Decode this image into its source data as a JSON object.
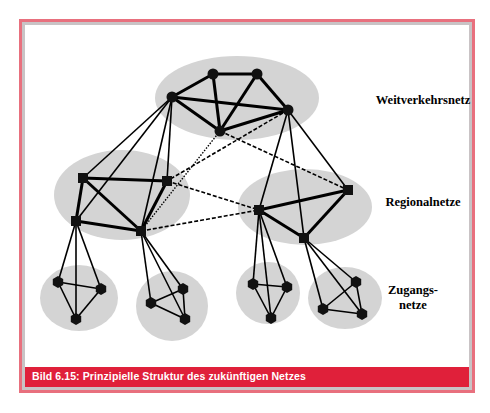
{
  "caption": "Bild 6.15: Prinzipielle Struktur des zukünftigen Netzes",
  "labels": {
    "core": "Weitverkehrsnetz",
    "regional": "Regionalnetze",
    "access_line1": "Zugangs-",
    "access_line2": "netze"
  },
  "colors": {
    "frame_border": "#e8707e",
    "inner_border": "#c9c3c5",
    "caption_bg": "#e0203a",
    "cluster_fill": "#d4d4d4",
    "node": "#111111"
  },
  "diagram": {
    "clusters": [
      {
        "name": "core",
        "cx": 237,
        "cy": 98,
        "rx": 82,
        "ry": 42
      },
      {
        "name": "regional-left",
        "cx": 122,
        "cy": 195,
        "rx": 68,
        "ry": 45
      },
      {
        "name": "regional-right",
        "cx": 305,
        "cy": 207,
        "rx": 67,
        "ry": 38
      },
      {
        "name": "access-1",
        "cx": 79,
        "cy": 298,
        "rx": 39,
        "ry": 33
      },
      {
        "name": "access-2",
        "cx": 172,
        "cy": 306,
        "rx": 36,
        "ry": 35
      },
      {
        "name": "access-3",
        "cx": 268,
        "cy": 293,
        "rx": 32,
        "ry": 31
      },
      {
        "name": "access-4",
        "cx": 345,
        "cy": 298,
        "rx": 37,
        "ry": 31
      }
    ],
    "nodes": {
      "A": {
        "x": 213,
        "y": 74,
        "shape": "circle"
      },
      "B": {
        "x": 257,
        "y": 74,
        "shape": "circle"
      },
      "C": {
        "x": 172,
        "y": 97,
        "shape": "circle"
      },
      "D": {
        "x": 288,
        "y": 110,
        "shape": "circle"
      },
      "E": {
        "x": 220,
        "y": 131,
        "shape": "circle"
      },
      "P": {
        "x": 83,
        "y": 178,
        "shape": "square"
      },
      "Q": {
        "x": 167,
        "y": 181,
        "shape": "square"
      },
      "R": {
        "x": 76,
        "y": 221,
        "shape": "square"
      },
      "S": {
        "x": 141,
        "y": 231,
        "shape": "square"
      },
      "T": {
        "x": 259,
        "y": 210,
        "shape": "square"
      },
      "U": {
        "x": 348,
        "y": 190,
        "shape": "square"
      },
      "V": {
        "x": 304,
        "y": 238,
        "shape": "square"
      },
      "a1": {
        "x": 58,
        "y": 282,
        "shape": "hex"
      },
      "a2": {
        "x": 101,
        "y": 289,
        "shape": "hex"
      },
      "a3": {
        "x": 76,
        "y": 319,
        "shape": "hex"
      },
      "b1": {
        "x": 183,
        "y": 289,
        "shape": "hex"
      },
      "b2": {
        "x": 151,
        "y": 303,
        "shape": "hex"
      },
      "b3": {
        "x": 185,
        "y": 319,
        "shape": "hex"
      },
      "c1": {
        "x": 253,
        "y": 284,
        "shape": "hex"
      },
      "c2": {
        "x": 287,
        "y": 287,
        "shape": "hex"
      },
      "c3": {
        "x": 271,
        "y": 318,
        "shape": "hex"
      },
      "d1": {
        "x": 356,
        "y": 282,
        "shape": "hex"
      },
      "d2": {
        "x": 323,
        "y": 309,
        "shape": "hex"
      },
      "d3": {
        "x": 362,
        "y": 314,
        "shape": "hex"
      }
    },
    "edges_thick": [
      [
        "C",
        "A"
      ],
      [
        "A",
        "B"
      ],
      [
        "B",
        "D"
      ],
      [
        "C",
        "D"
      ],
      [
        "C",
        "E"
      ],
      [
        "A",
        "E"
      ],
      [
        "B",
        "E"
      ],
      [
        "D",
        "E"
      ],
      [
        "P",
        "Q"
      ],
      [
        "P",
        "R"
      ],
      [
        "P",
        "S"
      ],
      [
        "Q",
        "S"
      ],
      [
        "R",
        "S"
      ],
      [
        "T",
        "U"
      ],
      [
        "T",
        "V"
      ],
      [
        "U",
        "V"
      ]
    ],
    "edges_thin": [
      [
        "C",
        "P"
      ],
      [
        "C",
        "R"
      ],
      [
        "C",
        "Q"
      ],
      [
        "C",
        "S"
      ],
      [
        "D",
        "T"
      ],
      [
        "D",
        "V"
      ],
      [
        "D",
        "U"
      ],
      [
        "a1",
        "a2"
      ],
      [
        "a1",
        "a3"
      ],
      [
        "a2",
        "a3"
      ],
      [
        "b1",
        "b2"
      ],
      [
        "b2",
        "b3"
      ],
      [
        "b1",
        "b3"
      ],
      [
        "c1",
        "c2"
      ],
      [
        "c1",
        "c3"
      ],
      [
        "c2",
        "c3"
      ],
      [
        "d1",
        "d2"
      ],
      [
        "d2",
        "d3"
      ],
      [
        "d1",
        "d3"
      ],
      [
        "R",
        "a1"
      ],
      [
        "R",
        "a2"
      ],
      [
        "R",
        "a3"
      ],
      [
        "S",
        "b1"
      ],
      [
        "S",
        "b2"
      ],
      [
        "S",
        "b3"
      ],
      [
        "T",
        "c1"
      ],
      [
        "T",
        "c2"
      ],
      [
        "T",
        "c3"
      ],
      [
        "V",
        "d1"
      ],
      [
        "V",
        "d2"
      ],
      [
        "V",
        "d3"
      ]
    ],
    "edges_dashed": [
      [
        "D",
        "Q"
      ],
      [
        "E",
        "U"
      ],
      [
        "Q",
        "T"
      ],
      [
        "S",
        "T"
      ]
    ],
    "edges_dotted": [
      [
        "E",
        "S"
      ]
    ]
  }
}
